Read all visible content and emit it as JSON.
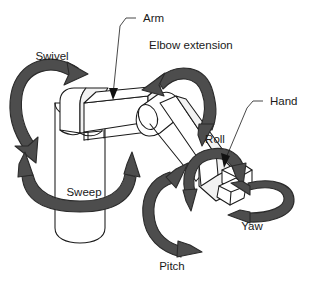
{
  "diagram": {
    "background_color": "#ffffff",
    "line_color": "#1a1a1a",
    "arrow_fill_color": "#4d4d4d",
    "arrow_stroke_color": "#2b2b2b",
    "part_labels": [
      {
        "id": "arm",
        "text": "Arm",
        "x": 143,
        "y": 22
      },
      {
        "id": "hand",
        "text": "Hand",
        "x": 270,
        "y": 105
      }
    ],
    "motion_labels": [
      {
        "id": "swivel",
        "text": "Swivel",
        "x": 52,
        "y": 60
      },
      {
        "id": "elbow-extension",
        "text": "Elbow extension",
        "x": 149,
        "y": 49
      },
      {
        "id": "roll",
        "text": "Roll",
        "x": 215,
        "y": 143
      },
      {
        "id": "sweep",
        "text": "Sweep",
        "x": 84,
        "y": 196
      },
      {
        "id": "yaw",
        "text": "Yaw",
        "x": 252,
        "y": 230
      },
      {
        "id": "pitch",
        "text": "Pitch",
        "x": 172,
        "y": 270
      }
    ],
    "motions": [
      {
        "id": "swivel",
        "label": "Swivel",
        "kind": "double-headed-arc",
        "axis": "shoulder-vertical"
      },
      {
        "id": "elbow-extension",
        "label": "Elbow extension",
        "kind": "double-headed-arc",
        "axis": "elbow"
      },
      {
        "id": "sweep",
        "label": "Sweep",
        "kind": "double-headed-arc",
        "axis": "base-rotation"
      },
      {
        "id": "pitch",
        "label": "Pitch",
        "kind": "double-headed-arc",
        "axis": "wrist-pitch"
      },
      {
        "id": "roll",
        "label": "Roll",
        "kind": "double-headed-arc",
        "axis": "wrist-roll"
      },
      {
        "id": "yaw",
        "label": "Yaw",
        "kind": "double-headed-loop",
        "axis": "wrist-yaw"
      }
    ],
    "parts": [
      {
        "id": "base-column",
        "name": "base column"
      },
      {
        "id": "shoulder-joint",
        "name": "shoulder joint"
      },
      {
        "id": "upper-arm",
        "name": "upper arm"
      },
      {
        "id": "elbow-joint",
        "name": "elbow joint"
      },
      {
        "id": "forearm",
        "name": "forearm"
      },
      {
        "id": "wrist",
        "name": "wrist"
      },
      {
        "id": "gripper",
        "name": "gripper hand"
      }
    ]
  }
}
